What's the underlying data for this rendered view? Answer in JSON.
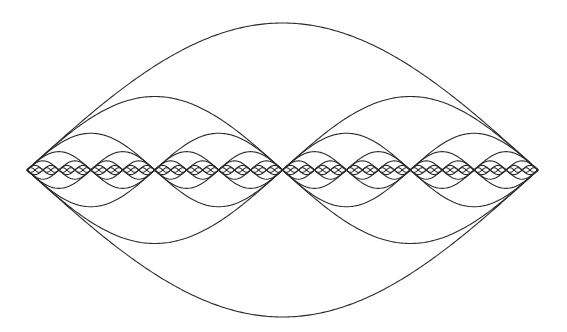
{
  "diagram": {
    "title": "",
    "stroke_color": "#2a2a2a",
    "background_color": "#ffffff",
    "x_start": 27,
    "x_end": 538,
    "baseline_y": 170,
    "base_amplitude": 147,
    "levels": [
      {
        "level": 1,
        "arches": 1,
        "amplitude": 147
      },
      {
        "level": 2,
        "arches": 2,
        "amplitude": 73.5
      },
      {
        "level": 3,
        "arches": 4,
        "amplitude": 36.75
      },
      {
        "level": 4,
        "arches": 8,
        "amplitude": 18.4
      },
      {
        "level": 5,
        "arches": 16,
        "amplitude": 9.2
      },
      {
        "level": 6,
        "arches": 32,
        "amplitude": 4.6
      },
      {
        "level": 7,
        "arches": 64,
        "amplitude": 2.3
      }
    ],
    "mirrored": true
  }
}
